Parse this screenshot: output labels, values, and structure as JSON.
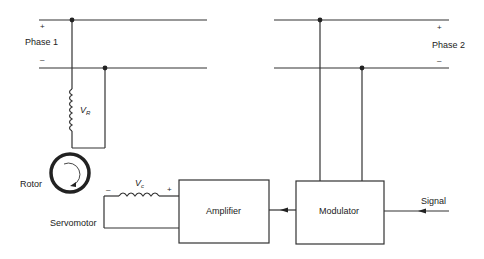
{
  "diagram": {
    "phase1": {
      "label": "Phase 1",
      "plus": "+",
      "minus": "–"
    },
    "phase2": {
      "label": "Phase 2",
      "plus": "+",
      "minus": "–"
    },
    "reference_winding": {
      "symbol": "V",
      "subscript": "R"
    },
    "control_winding": {
      "symbol": "V",
      "subscript": "c",
      "minus": "–",
      "plus": "+"
    },
    "rotor_label": "Rotor",
    "servomotor_label": "Servomotor",
    "amplifier_label": "Amplifier",
    "modulator_label": "Modulator",
    "signal_label": "Signal",
    "colors": {
      "line": "#333333",
      "background": "#ffffff"
    }
  }
}
